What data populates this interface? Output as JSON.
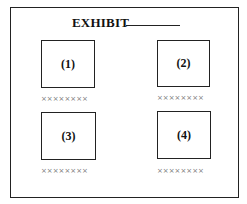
{
  "exhibit": {
    "title": "EXHIBIT",
    "panels": [
      {
        "label": "(1)",
        "caption": "××××××××"
      },
      {
        "label": "(2)",
        "caption": "××××××××"
      },
      {
        "label": "(3)",
        "caption": "××××××××"
      },
      {
        "label": "(4)",
        "caption": "××××××××"
      }
    ]
  }
}
